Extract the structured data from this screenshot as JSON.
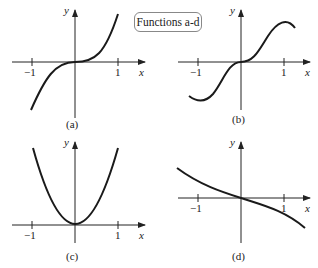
{
  "title": "Functions a-d",
  "panels": [
    {
      "id": "a",
      "caption": "(a)",
      "x_label": "x",
      "y_label": "y",
      "ticks": [
        "−1",
        "1"
      ],
      "shape": "cubic-like increasing (flat near 0)"
    },
    {
      "id": "b",
      "caption": "(b)",
      "x_label": "x",
      "y_label": "y",
      "ticks": [
        "−1",
        "1"
      ],
      "shape": "increasing with local min near x≈-1.1 and local max near x≈1.1, flat near 0"
    },
    {
      "id": "c",
      "caption": "(c)",
      "x_label": "x",
      "y_label": "y",
      "ticks": [
        "−1",
        "1"
      ],
      "shape": "parabola-like, min at 0"
    },
    {
      "id": "d",
      "caption": "(d)",
      "x_label": "x",
      "y_label": "y",
      "ticks": [
        "−1",
        "1"
      ],
      "shape": "decreasing, passes through origin"
    }
  ],
  "colors": {
    "curve": "#1a1a1a",
    "axis": "#222222",
    "box_border": "#888888"
  }
}
